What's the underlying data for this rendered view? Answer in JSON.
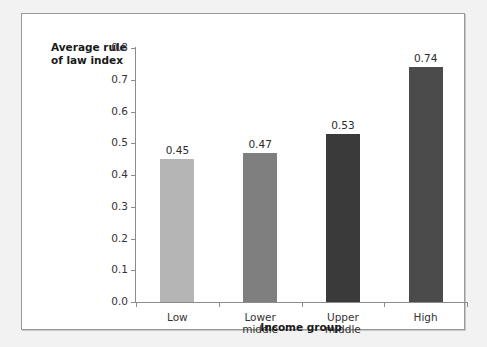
{
  "figure": {
    "background_color": "#f2f2f2",
    "panel_color": "#ffffff",
    "border_color": "#9a9a9a"
  },
  "chart_data": {
    "type": "bar",
    "title": "",
    "subtitle": "",
    "xlabel": "Income group",
    "ylabel": "Average rule of law index",
    "categories": [
      "Low",
      "Lower\nmiddle",
      "Upper\nmiddle",
      "High"
    ],
    "values": [
      0.45,
      0.47,
      0.53,
      0.74
    ],
    "value_labels": [
      "0.45",
      "0.47",
      "0.53",
      "0.74"
    ],
    "bar_colors": [
      "#b5b5b5",
      "#7f7f7f",
      "#3a3a3a",
      "#4b4b4b"
    ],
    "ylim": [
      0.0,
      0.8
    ],
    "ytick_values": [
      0.8,
      0.7,
      0.6,
      0.5,
      0.4,
      0.3,
      0.2,
      0.1,
      0.0
    ],
    "ytick_labels": [
      "0.8",
      "0.7",
      "0.6",
      "0.5",
      "0.4",
      "0.3",
      "0.2",
      "0.1",
      "0.0"
    ],
    "grid": false,
    "legend": false,
    "legend_position": "none",
    "axis_color": "#8c8c8c",
    "text_color": "#333333"
  }
}
